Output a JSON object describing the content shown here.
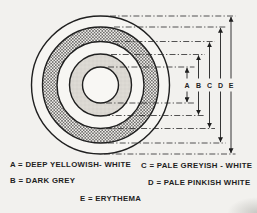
{
  "dimensions": {
    "labels": [
      "A",
      "B",
      "C",
      "D",
      "E"
    ]
  },
  "legend": {
    "items": [
      {
        "text": "A = DEEP YELLOWISH- WHITE"
      },
      {
        "text": "B = DARK GREY"
      },
      {
        "text": "C = PALE GREYISH - WHITE"
      },
      {
        "text": "D = PALE PINKISH WHITE"
      },
      {
        "text": "E = ERYTHEMA"
      }
    ]
  },
  "colors": {
    "ink": "#1f1f1f",
    "paper": "#f2f1ee",
    "ring_grey": "#dbd8d2",
    "hatch": "#3a3a38"
  }
}
